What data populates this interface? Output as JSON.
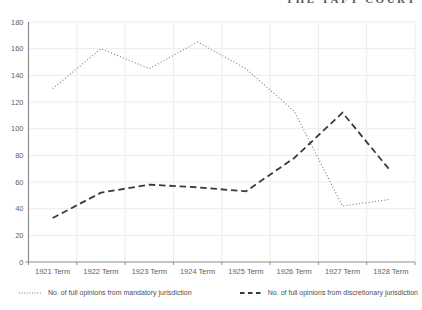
{
  "header": {
    "running_title": "THE TAFT COURT"
  },
  "chart_data": {
    "type": "line",
    "categories": [
      "1921 Term",
      "1922 Term",
      "1923 Term",
      "1924 Term",
      "1925 Term",
      "1926 Term",
      "1927 Term",
      "1928 Term"
    ],
    "series": [
      {
        "name": "No. of full opinions from mandatory jurisdiction",
        "style": "dotted",
        "color": "#7d7d7d",
        "values": [
          130,
          160,
          145,
          165,
          145,
          113,
          42,
          47
        ]
      },
      {
        "name": "No. of full opinions from discretionary jurisdiction",
        "style": "dashed",
        "color": "#3a3a3a",
        "values": [
          33,
          52,
          58,
          56,
          53,
          78,
          112,
          68
        ]
      }
    ],
    "title": "",
    "xlabel": "",
    "ylabel": "",
    "ylim": [
      0,
      180
    ],
    "ytick_step": 20,
    "yticks": [
      0,
      20,
      40,
      60,
      80,
      100,
      120,
      140,
      160,
      180
    ],
    "grid": "both",
    "legend_position": "bottom"
  },
  "colors": {
    "background": "#ffffff",
    "gridline": "#ececec",
    "axis": "#8c8c8c",
    "tick_label": "#5f5f5f"
  }
}
